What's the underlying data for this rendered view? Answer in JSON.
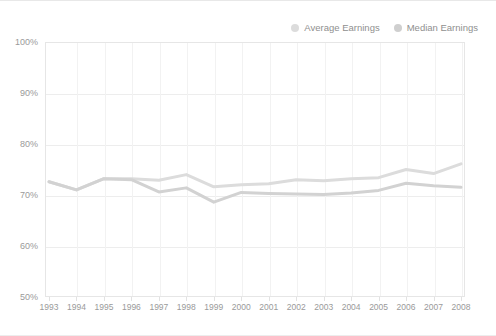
{
  "chart_data": {
    "type": "line",
    "title": "",
    "xlabel": "",
    "ylabel": "",
    "x": [
      1993,
      1994,
      1995,
      1996,
      1997,
      1998,
      1999,
      2000,
      2001,
      2002,
      2003,
      2004,
      2005,
      2006,
      2007,
      2008
    ],
    "categories": [
      "1993",
      "1994",
      "1995",
      "1996",
      "1997",
      "1998",
      "1999",
      "2000",
      "2001",
      "2002",
      "2003",
      "2004",
      "2005",
      "2006",
      "2007",
      "2008"
    ],
    "series": [
      {
        "name": "Average Earnings",
        "color": "#dcdcdc",
        "values": [
          72.6,
          71.0,
          73.2,
          73.2,
          72.9,
          74.0,
          71.6,
          72.0,
          72.2,
          73.0,
          72.8,
          73.2,
          73.4,
          75.0,
          74.2,
          76.1
        ]
      },
      {
        "name": "Median Earnings",
        "color": "#d2d2d2",
        "values": [
          72.6,
          71.0,
          73.2,
          73.0,
          70.6,
          71.4,
          68.6,
          70.5,
          70.3,
          70.2,
          70.1,
          70.4,
          70.9,
          72.3,
          71.8,
          71.5
        ]
      }
    ],
    "ylim": [
      50,
      100
    ],
    "ytick_values": [
      100,
      90,
      80,
      70,
      60,
      50
    ],
    "ytick_labels": [
      "100%",
      "90%",
      "80%",
      "70%",
      "60%",
      "50%"
    ],
    "grid": true,
    "legend_position": "top-right"
  },
  "legend": {
    "entries": [
      {
        "label": "Average Earnings",
        "marker": "legend-dot-average",
        "color": "#dcdcdc"
      },
      {
        "label": "Median Earnings",
        "marker": "legend-dot-median",
        "color": "#cfcfcf"
      }
    ]
  },
  "style": {
    "background": "#ffffff",
    "grid_color": "#ededed",
    "axis_text_color": "#9a9a9a",
    "frame_color": "#e6e6e6"
  }
}
